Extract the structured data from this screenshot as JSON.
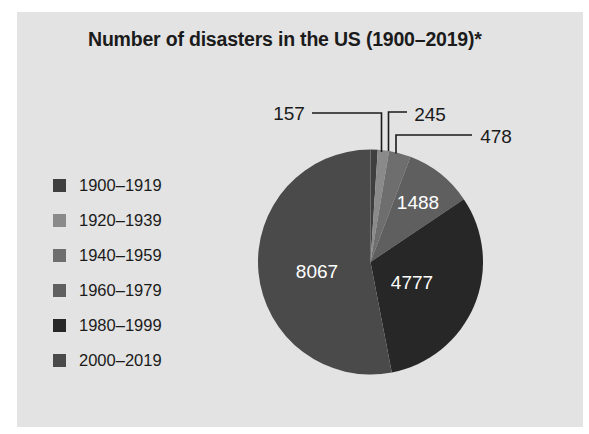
{
  "chart_data": {
    "type": "pie",
    "title": "Number of disasters in the US (1900–2019)*",
    "categories": [
      "1900–1919",
      "1920–1939",
      "1940–1959",
      "1960–1979",
      "1980–1999",
      "2000–2019"
    ],
    "values": [
      157,
      245,
      478,
      1488,
      4777,
      8067
    ],
    "value_labels": [
      "157",
      "245",
      "478",
      "1488",
      "4777",
      "8067"
    ],
    "total": 15212,
    "colors": [
      "#3f3f3f",
      "#8a8a8a",
      "#6e6e6e",
      "#5f5f5f",
      "#272727",
      "#4a4a4a"
    ],
    "label_placement": [
      "outside",
      "outside",
      "outside",
      "inside",
      "inside",
      "inside"
    ],
    "start_angle_deg": 0,
    "direction": "clockwise",
    "legend_position": "left",
    "grid": false,
    "xlabel": "",
    "ylabel": ""
  },
  "panel": {
    "background": "#e3e3e3"
  },
  "title": {
    "text": "Number of disasters in the US (1900–2019)*"
  },
  "legend": {
    "items": [
      {
        "label": "1900–1919",
        "color": "#3f3f3f"
      },
      {
        "label": "1920–1939",
        "color": "#8a8a8a"
      },
      {
        "label": "1940–1959",
        "color": "#6e6e6e"
      },
      {
        "label": "1960–1979",
        "color": "#5f5f5f"
      },
      {
        "label": "1980–1999",
        "color": "#272727"
      },
      {
        "label": "2000–2019",
        "color": "#4a4a4a"
      }
    ]
  },
  "pie_labels": {
    "outside": [
      {
        "name": "157",
        "text": "157",
        "x": 289,
        "y": 114
      },
      {
        "name": "245",
        "text": "245",
        "x": 430,
        "y": 115
      },
      {
        "name": "478",
        "text": "478",
        "x": 496,
        "y": 137
      }
    ],
    "inside": [
      {
        "name": "1488",
        "text": "1488",
        "x": 418,
        "y": 203
      },
      {
        "name": "4777",
        "text": "4777",
        "x": 412,
        "y": 283
      },
      {
        "name": "8067",
        "text": "8067",
        "x": 317,
        "y": 272
      }
    ]
  }
}
